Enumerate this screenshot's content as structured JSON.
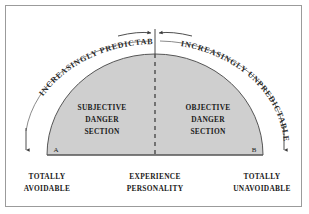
{
  "figure": {
    "border_color": "#9b9b9b",
    "background_color": "#ffffff"
  },
  "dome": {
    "fill_color": "#cfcfcf",
    "stroke_color": "#555555",
    "left_marker": "A",
    "right_marker": "B"
  },
  "sections": {
    "left": {
      "line1": "SUBJECTIVE",
      "line2": "DANGER",
      "line3": "SECTION"
    },
    "right": {
      "line1": "OBJECTIVE",
      "line2": "DANGER",
      "line3": "SECTION"
    }
  },
  "arcs": {
    "left_label": "INCREASINGLY PREDICTABLE",
    "right_label": "INCREASINGLY UNPREDICTABLE"
  },
  "endpoints": {
    "left": {
      "line1": "TOTALLY",
      "line2": "AVOIDABLE"
    },
    "center": {
      "line1": "EXPERIENCE",
      "line2": "PERSONALITY"
    },
    "right": {
      "line1": "TOTALLY",
      "line2": "UNAVOIDABLE"
    }
  },
  "center_divider": {
    "style": "dashed",
    "color": "#4a4a4a"
  }
}
